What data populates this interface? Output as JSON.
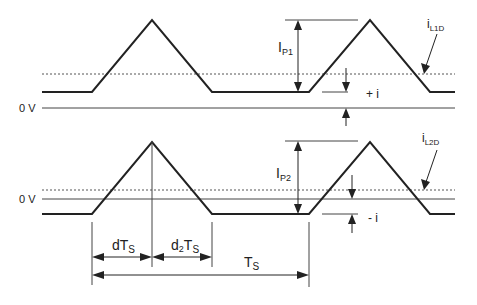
{
  "diagram": {
    "colors": {
      "line": "#222222",
      "grid": "#444444",
      "dashed": "#555555",
      "background": "#ffffff"
    },
    "top_trace": {
      "zero_label": "0 V",
      "peak_label": "I",
      "peak_sub": "P1",
      "signal_label": "i",
      "signal_sub": "L1D",
      "offset_label": "+ i"
    },
    "bottom_trace": {
      "zero_label": "0 V",
      "peak_label": "I",
      "peak_sub": "P2",
      "signal_label": "i",
      "signal_sub": "L2D",
      "offset_label": "- i"
    },
    "timing": {
      "d_label": "dT",
      "d_sub": "S",
      "d2_label": "d",
      "d2_sub_num": "2",
      "d2_label_t": "T",
      "d2_sub": "S",
      "period_label": "T",
      "period_sub": "S"
    }
  }
}
